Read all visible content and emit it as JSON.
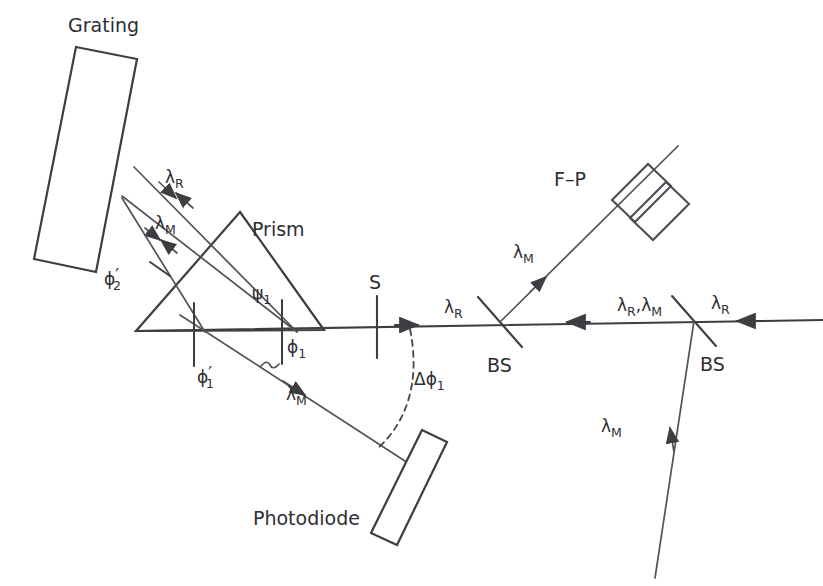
{
  "figure": {
    "type": "optical-layout-diagram",
    "title": "",
    "background_color": "#ffffff",
    "line_color": "#3d3d42",
    "text_color": "#2e2e33"
  },
  "components": {
    "grating": {
      "label": "Grating",
      "shape": "rectangle",
      "orientation": "tilted",
      "role": "diffraction grating"
    },
    "prism": {
      "label": "Prism",
      "shape": "triangle",
      "role": "dispersing prism"
    },
    "slit": {
      "label": "S",
      "shape": "vertical-line",
      "role": "slit / aperture"
    },
    "beamsplitter_left": {
      "label": "BS",
      "shape": "tilted-line",
      "role": "beam splitter"
    },
    "beamsplitter_right": {
      "label": "BS",
      "shape": "tilted-line",
      "role": "beam splitter"
    },
    "fabry_perot": {
      "label": "F–P",
      "shape": "two-tilted-plates",
      "role": "Fabry-Perot etalon"
    },
    "photodiode": {
      "label": "Photodiode",
      "shape": "tilted-bar",
      "role": "detector"
    }
  },
  "beam_labels": {
    "lambda_R_grating": "λ",
    "lambda_R_grating_sub": "R",
    "lambda_M_grating": "λ",
    "lambda_M_grating_sub": "M",
    "lambda_M_photodiode": "λ",
    "lambda_M_photodiode_sub": "M",
    "lambda_R_bs_left": "λ",
    "lambda_R_bs_left_sub": "R",
    "lambda_M_fp": "λ",
    "lambda_M_fp_sub": "M",
    "lambda_RM_between": "λ",
    "lambda_RM_between_sub1": "R",
    "lambda_RM_between_comma": ",λ",
    "lambda_RM_between_sub2": "M",
    "lambda_R_input": "λ",
    "lambda_R_input_sub": "R",
    "lambda_M_input": "λ",
    "lambda_M_input_sub": "M"
  },
  "angle_labels": {
    "phi2_prime": "ϕ",
    "phi2_prime_sub": "2",
    "phi2_prime_mark": "′",
    "phi1_prime": "ϕ",
    "phi1_prime_sub": "1",
    "phi1_prime_mark": "′",
    "psi1": "ψ",
    "psi1_sub": "1",
    "phi1": "ϕ",
    "phi1_sub": "1",
    "delta_phi1": "Δϕ",
    "delta_phi1_sub": "1"
  },
  "text_items": [
    {
      "name": "grating-label",
      "text": "Grating"
    },
    {
      "name": "prism-label",
      "text": "Prism"
    },
    {
      "name": "slit-label",
      "text": "S"
    },
    {
      "name": "fp-label",
      "text": "F–P"
    },
    {
      "name": "bs-left-label",
      "text": "BS"
    },
    {
      "name": "bs-right-label",
      "text": "BS"
    },
    {
      "name": "photodiode-label",
      "text": "Photodiode"
    }
  ]
}
